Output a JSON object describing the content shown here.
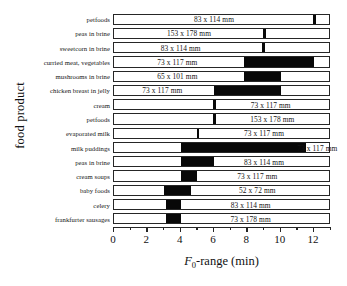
{
  "chart_data": {
    "type": "bar",
    "title": "",
    "subtitle": "",
    "xlabel": "F0-range (min)",
    "xlabel_parts": {
      "symbol": "F",
      "subscript": "0",
      "rest": "-range (min)"
    },
    "ylabel": "food product",
    "xlim": [
      0,
      13.02
    ],
    "ylim_categories": 15,
    "grid": false,
    "legend": null,
    "xticks": [
      0,
      2,
      4,
      6,
      8,
      10,
      12
    ],
    "xticklabels": [
      "0",
      "2",
      "4",
      "6",
      "8",
      "10",
      "12"
    ],
    "orientation": "horizontal",
    "bar_style": "range-bars-in-full-width-boxes",
    "bar_color": "#080808",
    "box_border_color": "#262626",
    "box_fill_color": "#ffffff",
    "categories": [
      "petfoods",
      "peas in brine",
      "sweetcorn in brine",
      "curried meat, vegetables",
      "mushrooms in brine",
      "chicken breast in jelly",
      "cream",
      "petfoods",
      "evaporated milk",
      "milk puddings",
      "peas in brine",
      "cream soups",
      "baby foods",
      "celery",
      "frankfurter sausages"
    ],
    "annotations": [
      "83 x 114 mm",
      "153 x 178 mm",
      "83 x 114 mm",
      "73 x 117 mm",
      "65 x 101 mm",
      "73 x 117 mm",
      "73 x 117 mm",
      "153 x 178 mm",
      "73 x 117 mm",
      "73 x 117 mm",
      "83 x 114 mm",
      "73 x 117 mm",
      "52 x 72 mm",
      "83 x 114 mm",
      "73 x 178 mm"
    ],
    "ranges": [
      {
        "label": "petfoods",
        "can_size": "83 x 114 mm",
        "start": 11.95,
        "end": 12.15,
        "text_center": 6.0,
        "text_align": "center"
      },
      {
        "label": "peas in brine",
        "can_size": "153 x 178 mm",
        "start": 8.95,
        "end": 9.15,
        "text_center": 4.5,
        "text_align": "center"
      },
      {
        "label": "sweetcorn in brine",
        "can_size": "83 x 114 mm",
        "start": 8.85,
        "end": 9.05,
        "text_center": 4.0,
        "text_align": "center"
      },
      {
        "label": "curried meat, vegetables",
        "can_size": "73 x 117 mm",
        "start": 7.8,
        "end": 12.0,
        "text_center": 3.8,
        "text_align": "center"
      },
      {
        "label": "mushrooms in brine",
        "can_size": "65 x 101 mm",
        "start": 7.8,
        "end": 10.0,
        "text_center": 3.8,
        "text_align": "center"
      },
      {
        "label": "chicken breast in jelly",
        "can_size": "73 x 117 mm",
        "start": 6.0,
        "end": 10.0,
        "text_center": 2.9,
        "text_align": "center"
      },
      {
        "label": "cream",
        "can_size": "73 x 117 mm",
        "start": 5.95,
        "end": 6.15,
        "text_center": 9.4,
        "text_align": "center"
      },
      {
        "label": "petfoods",
        "can_size": "153 x 178 mm",
        "start": 5.95,
        "end": 6.15,
        "text_center": 9.5,
        "text_align": "center"
      },
      {
        "label": "evaporated milk",
        "can_size": "73 x 117 mm",
        "start": 4.95,
        "end": 5.12,
        "text_center": 9.0,
        "text_align": "center"
      },
      {
        "label": "milk puddings",
        "can_size": "73 x 117 mm",
        "start": 4.0,
        "end": 11.55,
        "text_center": 12.2,
        "text_align": "center"
      },
      {
        "label": "peas in brine",
        "can_size": "83 x 114 mm",
        "start": 4.0,
        "end": 6.0,
        "text_center": 9.0,
        "text_align": "center"
      },
      {
        "label": "cream soups",
        "can_size": "73 x 117 mm",
        "start": 4.0,
        "end": 5.0,
        "text_center": 8.6,
        "text_align": "center"
      },
      {
        "label": "baby foods",
        "can_size": "52 x 72 mm",
        "start": 3.0,
        "end": 4.6,
        "text_center": 8.6,
        "text_align": "center"
      },
      {
        "label": "celery",
        "can_size": "83 x 114 mm",
        "start": 3.1,
        "end": 4.0,
        "text_center": 8.2,
        "text_align": "center"
      },
      {
        "label": "frankfurter sausages",
        "can_size": "73 x 178 mm",
        "start": 3.1,
        "end": 4.0,
        "text_center": 8.2,
        "text_align": "center"
      }
    ]
  }
}
